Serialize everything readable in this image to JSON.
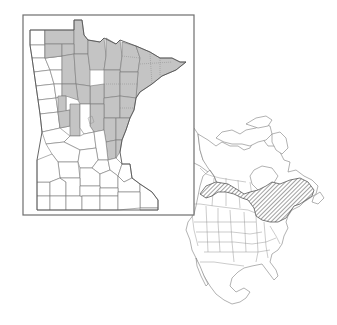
{
  "figure": {
    "type": "species-distribution-map",
    "panels": [
      {
        "name": "minnesota-county-map",
        "region": "Minnesota",
        "encoding": "shaded counties indicate recorded presence",
        "shaded_area": "northern and north-central Minnesota, including the Arrowhead region, extending south toward the east-central counties"
      },
      {
        "name": "north-america-range-map",
        "region": "North America",
        "encoding": "hatched area indicates species range",
        "range_area": "southern boreal Canada from the prairie provinces east through Ontario and Quebec to the Atlantic provinces, including the upper Great Lakes and northern New England"
      }
    ]
  },
  "colors": {
    "county_present": "#c4c4c4",
    "county_absent": "#ffffff",
    "outline": "#7a7a7a",
    "frame": "#6e6e6e",
    "hatch": "#444444"
  }
}
